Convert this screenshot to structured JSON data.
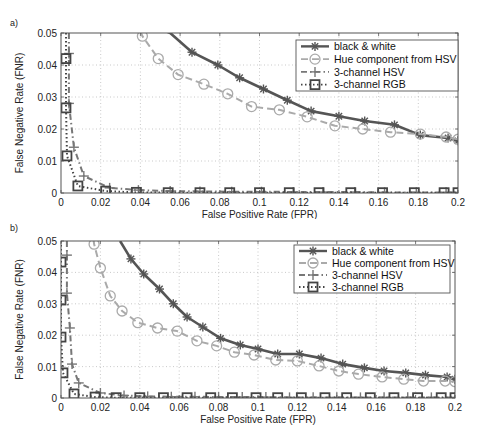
{
  "chart_data": [
    {
      "type": "line",
      "panel_label": "a)",
      "xlabel": "False Positive Rate (FPR)",
      "ylabel": "False Negative Rate (FNR)",
      "xlim": [
        0,
        0.2
      ],
      "ylim": [
        0,
        0.05
      ],
      "xticks": [
        0,
        0.02,
        0.04,
        0.06,
        0.08,
        0.1,
        0.12,
        0.14,
        0.16,
        0.18,
        0.2
      ],
      "xtick_labels": [
        "0",
        "0.02",
        "0.04",
        "0.06",
        "0.08",
        "0.1",
        "0.12",
        "0.14",
        "0.16",
        "0.18",
        "0.2"
      ],
      "yticks": [
        0,
        0.01,
        0.02,
        0.03,
        0.04,
        0.05
      ],
      "ytick_labels": [
        "0",
        "0.01",
        "0.02",
        "0.03",
        "0.04",
        "0.05"
      ],
      "grid": true,
      "legend_position": "upper right",
      "series": [
        {
          "name": "black & white",
          "style": "solid",
          "marker": "asterisk",
          "color": "#555555",
          "x": [
            0.053,
            0.055,
            0.066,
            0.079,
            0.09,
            0.102,
            0.114,
            0.126,
            0.14,
            0.153,
            0.168,
            0.181,
            0.195,
            0.2
          ],
          "y": [
            0.0505,
            0.05,
            0.044,
            0.04,
            0.036,
            0.0325,
            0.029,
            0.0256,
            0.024,
            0.0225,
            0.0213,
            0.0181,
            0.0172,
            0.0163
          ]
        },
        {
          "name": "Hue component from HSV",
          "style": "dashed",
          "marker": "circle",
          "color": "#aaaaaa",
          "x": [
            0.04,
            0.041,
            0.049,
            0.059,
            0.072,
            0.084,
            0.096,
            0.11,
            0.124,
            0.138,
            0.152,
            0.166,
            0.181,
            0.194,
            0.2
          ],
          "y": [
            0.0505,
            0.049,
            0.042,
            0.037,
            0.034,
            0.031,
            0.027,
            0.026,
            0.0238,
            0.021,
            0.02,
            0.019,
            0.0184,
            0.0175,
            0.0168
          ]
        },
        {
          "name": "3-channel HSV",
          "style": "dashdot",
          "marker": "plus",
          "color": "#777777",
          "x": [
            0.004,
            0.004,
            0.004,
            0.0065,
            0.0115,
            0.0245,
            0.039,
            0.055,
            0.07,
            0.086,
            0.101,
            0.117,
            0.132,
            0.148,
            0.163,
            0.179,
            0.194,
            0.2
          ],
          "y": [
            0.05,
            0.0436,
            0.028,
            0.0143,
            0.0053,
            0.0016,
            0.0009,
            0.0006,
            0.0005,
            0.0004,
            0.0004,
            0.0003,
            0.0003,
            0.0003,
            0.0002,
            0.0002,
            0.0002,
            0.0002
          ]
        },
        {
          "name": "3-channel RGB",
          "style": "dotted",
          "marker": "square",
          "color": "#444444",
          "x": [
            0.0025,
            0.0025,
            0.0025,
            0.003,
            0.0085,
            0.0225,
            0.038,
            0.054,
            0.07,
            0.085,
            0.1,
            0.115,
            0.13,
            0.146,
            0.162,
            0.178,
            0.193,
            0.2
          ],
          "y": [
            0.05,
            0.042,
            0.0266,
            0.0116,
            0.0022,
            0.0006,
            0.0002,
            0.0001,
            0.0001,
            0.0001,
            0.0001,
            0.0001,
            0.0001,
            0.0001,
            0.0001,
            0.0001,
            0.0001,
            0.0001
          ]
        }
      ]
    },
    {
      "type": "line",
      "panel_label": "b)",
      "xlabel": "False Positive Rate (FPR)",
      "ylabel": "False Negative Rate (FNR)",
      "xlim": [
        0,
        0.2
      ],
      "ylim": [
        0,
        0.05
      ],
      "xticks": [
        0,
        0.02,
        0.04,
        0.06,
        0.08,
        0.1,
        0.12,
        0.14,
        0.16,
        0.18,
        0.2
      ],
      "xtick_labels": [
        "0",
        "0.02",
        "0.04",
        "0.06",
        "0.08",
        "0.1",
        "0.12",
        "0.14",
        "0.16",
        "0.18",
        "0.2"
      ],
      "yticks": [
        0,
        0.01,
        0.02,
        0.03,
        0.04,
        0.05
      ],
      "ytick_labels": [
        "0",
        "0.01",
        "0.02",
        "0.03",
        "0.04",
        "0.05"
      ],
      "grid": true,
      "legend_position": "upper right",
      "series": [
        {
          "name": "black & white",
          "style": "solid",
          "marker": "asterisk",
          "color": "#555555",
          "x": [
            0.03,
            0.0355,
            0.042,
            0.05,
            0.057,
            0.064,
            0.072,
            0.081,
            0.091,
            0.1,
            0.11,
            0.121,
            0.132,
            0.143,
            0.154,
            0.164,
            0.175,
            0.185,
            0.196,
            0.2
          ],
          "y": [
            0.05,
            0.0443,
            0.0395,
            0.0347,
            0.03,
            0.0258,
            0.0226,
            0.019,
            0.0169,
            0.0156,
            0.014,
            0.014,
            0.0127,
            0.0108,
            0.0096,
            0.0086,
            0.008,
            0.0073,
            0.0067,
            0.006
          ]
        },
        {
          "name": "Hue component from HSV",
          "style": "dashed",
          "marker": "circle",
          "color": "#aaaaaa",
          "x": [
            0.0165,
            0.0168,
            0.02,
            0.025,
            0.031,
            0.039,
            0.049,
            0.059,
            0.069,
            0.079,
            0.088,
            0.098,
            0.109,
            0.12,
            0.131,
            0.141,
            0.151,
            0.163,
            0.174,
            0.184,
            0.195,
            0.2
          ],
          "y": [
            0.0505,
            0.049,
            0.0414,
            0.0325,
            0.0277,
            0.024,
            0.0223,
            0.0213,
            0.0182,
            0.0166,
            0.0146,
            0.0137,
            0.0121,
            0.0118,
            0.0102,
            0.0086,
            0.0076,
            0.0067,
            0.006,
            0.0054,
            0.0054,
            0.0052
          ]
        },
        {
          "name": "3-channel HSV",
          "style": "dashdot",
          "marker": "plus",
          "color": "#777777",
          "x": [
            0.003,
            0.003,
            0.003,
            0.0045,
            0.0056,
            0.009,
            0.02,
            0.032,
            0.044,
            0.056,
            0.068,
            0.08,
            0.092,
            0.104,
            0.116,
            0.128,
            0.14,
            0.152,
            0.164,
            0.176,
            0.188,
            0.2
          ],
          "y": [
            0.05,
            0.0455,
            0.0334,
            0.0223,
            0.0108,
            0.0048,
            0.0016,
            0.0008,
            0.0005,
            0.0004,
            0.0004,
            0.0003,
            0.0003,
            0.0003,
            0.0002,
            0.0002,
            0.0002,
            0.0002,
            0.0002,
            0.0002,
            0.0002,
            0.0002
          ]
        },
        {
          "name": "3-channel RGB",
          "style": "dotted",
          "marker": "square",
          "color": "#444444",
          "x": [
            0.0,
            0.0,
            0.0,
            0.0,
            0.001,
            0.0066,
            0.0173,
            0.028,
            0.04,
            0.052,
            0.064,
            0.076,
            0.087,
            0.099,
            0.11,
            0.122,
            0.134,
            0.145,
            0.157,
            0.169,
            0.181,
            0.193,
            0.2
          ],
          "y": [
            0.05,
            0.0433,
            0.0312,
            0.0194,
            0.008,
            0.0013,
            0.0003,
            0.0001,
            0.0001,
            0.0001,
            0.0001,
            0.0001,
            0.0001,
            0.0001,
            0.0001,
            0.0001,
            0.0001,
            0.0001,
            0.0001,
            0.0001,
            0.0001,
            0.0001,
            0.0001
          ]
        }
      ]
    }
  ],
  "panels": {
    "a": {
      "label": "a)",
      "xlabel": "False Positive Rate (FPR)",
      "ylabel": "False Negative Rate (FNR)"
    },
    "b": {
      "label": "b)",
      "xlabel": "False Positive Rate (FPR)",
      "ylabel": "False Negative Rate (FNR)"
    }
  },
  "legend": {
    "items": [
      {
        "label": "black & white",
        "marker": "asterisk",
        "style": "solid",
        "color": "#555555"
      },
      {
        "label": "Hue component from HSV",
        "marker": "circle",
        "style": "dashed",
        "color": "#aaaaaa"
      },
      {
        "label": "3-channel HSV",
        "marker": "plus",
        "style": "dashdot",
        "color": "#777777"
      },
      {
        "label": "3-channel RGB",
        "marker": "square",
        "style": "dotted",
        "color": "#444444"
      }
    ]
  }
}
